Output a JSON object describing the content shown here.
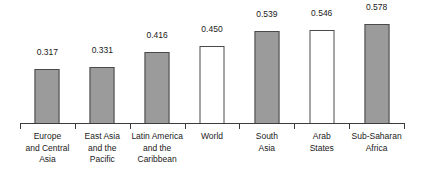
{
  "chart_data": {
    "type": "bar",
    "title": "",
    "subtitle": "",
    "xlabel": "",
    "ylabel": "",
    "ylim": [
      0,
      0.62
    ],
    "grid": false,
    "legend": "none",
    "axis": {
      "baseline_visible": true,
      "ticks_visible": true,
      "y_axis_visible": false,
      "value_label_format": "0.000"
    },
    "categories": [
      "Europe and Central Asia",
      "East Asia and the Pacific",
      "Latin America and the Caribbean",
      "World",
      "South Asia",
      "Arab States",
      "Sub-Saharan Africa"
    ],
    "category_lines": [
      [
        "Europe",
        "and Central",
        "Asia"
      ],
      [
        "East Asia",
        "and the",
        "Pacific"
      ],
      [
        "Latin America",
        "and the",
        "Caribbean"
      ],
      [
        "World"
      ],
      [
        "South",
        "Asia"
      ],
      [
        "Arab",
        "States"
      ],
      [
        "Sub-Saharan",
        "Africa"
      ]
    ],
    "values": [
      0.317,
      0.331,
      0.416,
      0.45,
      0.539,
      0.546,
      0.578
    ],
    "value_labels": [
      "0.317",
      "0.331",
      "0.416",
      "0.450",
      "0.539",
      "0.546",
      "0.578"
    ],
    "bar_styles": [
      "gray",
      "gray",
      "gray",
      "white",
      "gray",
      "white",
      "gray"
    ]
  },
  "colors": {
    "bar_fill_gray": "#9b9b9b",
    "bar_fill_white": "#ffffff",
    "bar_border": "#4a4a4a",
    "axis": "#3c3c3c",
    "text": "#1a1a1a",
    "background": "#ffffff"
  }
}
